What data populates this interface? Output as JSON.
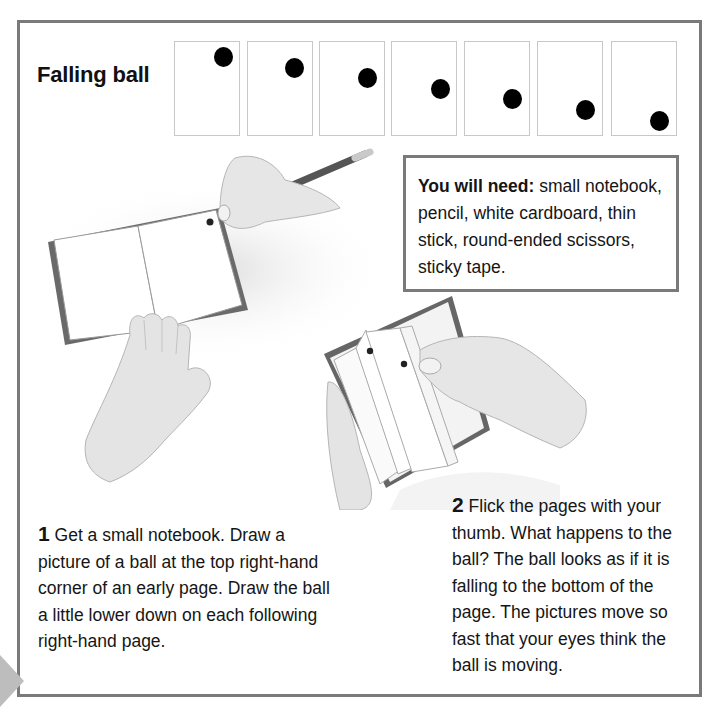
{
  "page": {
    "title": "Falling ball",
    "flipbook_frames": [
      {
        "frame": 1,
        "ball_x": 223,
        "ball_y": 56
      },
      {
        "frame": 2,
        "ball_x": 294,
        "ball_y": 67
      },
      {
        "frame": 3,
        "ball_x": 367,
        "ball_y": 77
      },
      {
        "frame": 4,
        "ball_x": 440,
        "ball_y": 88
      },
      {
        "frame": 5,
        "ball_x": 512,
        "ball_y": 98
      },
      {
        "frame": 6,
        "ball_x": 585,
        "ball_y": 109
      },
      {
        "frame": 7,
        "ball_x": 659,
        "ball_y": 120
      }
    ],
    "you_will_need": {
      "label": "You will need:",
      "items": " small notebook, pencil, white cardboard, thin stick, round-ended scissors, sticky tape."
    },
    "steps": [
      {
        "number": "1",
        "text": " Get a small notebook. Draw a picture of a ball at the top right-hand corner of an early page. Draw the ball a little lower down on each following right-hand page."
      },
      {
        "number": "2",
        "text": " Flick the pages with your thumb. What happens to the ball? The ball looks as if it is falling to the bottom of the page. The pictures move so fast that your eyes think the ball is moving."
      }
    ],
    "illustrations": [
      {
        "name": "hand-drawing-in-notebook",
        "description": "Open notebook with hand holding pencil drawing a ball in top right corner"
      },
      {
        "name": "hand-flicking-pages",
        "description": "Hands flicking the pages of a small notebook showing ball drawings"
      }
    ],
    "colors": {
      "frame_border": "#7a7a7a",
      "cell_border": "#c8c8c8",
      "ball": "#000000",
      "text": "#151515"
    }
  }
}
